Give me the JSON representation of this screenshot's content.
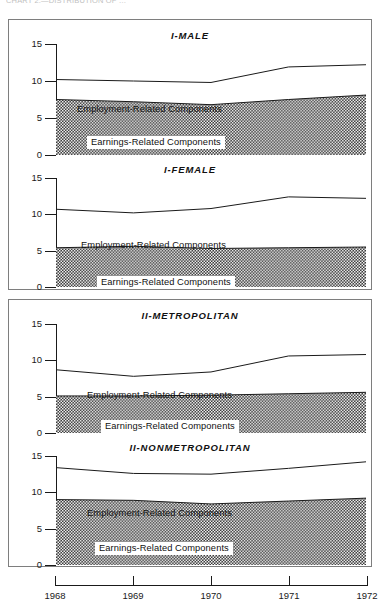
{
  "figure": {
    "caption_fragment": "CHART 2.—DISTRIBUTION OF …",
    "x_axis": {
      "tick_labels": [
        "1968",
        "1969",
        "1970",
        "1971",
        "1972"
      ],
      "values": [
        1968,
        1969,
        1970,
        1971,
        1972
      ]
    },
    "y_axis": {
      "tick_labels": [
        "0",
        "5",
        "10",
        "15"
      ],
      "values": [
        0,
        5,
        10,
        15
      ],
      "min": 0,
      "max": 15
    },
    "series_labels": {
      "employment": "Employment-Related Components",
      "earnings": "Earnings-Related Components"
    },
    "colors": {
      "axis": "#1a1a1a",
      "border": "#7e7e7e",
      "earnings_fill": "#3a3a3a",
      "employment_fill": "#ffffff",
      "line": "#1a1a1a"
    },
    "groups": [
      {
        "name": "group-1",
        "panels": [
          "I-MALE",
          "I-FEMALE"
        ]
      },
      {
        "name": "group-2",
        "panels": [
          "II-METROPOLITAN",
          "II-NONMETROPOLITAN"
        ]
      }
    ]
  },
  "chart_data": [
    {
      "type": "area",
      "title": "I-MALE",
      "xlabel": "",
      "ylabel": "",
      "x": [
        1968,
        1969,
        1970,
        1971,
        1972
      ],
      "xlim": [
        1968,
        1972
      ],
      "ylim": [
        0,
        15
      ],
      "yticks": [
        0,
        5,
        10,
        15
      ],
      "grid": false,
      "stacked": true,
      "legend": "inline-annotation",
      "series": [
        {
          "name": "Earnings-Related Components",
          "values": [
            7.5,
            7.2,
            6.8,
            7.5,
            8.1
          ]
        },
        {
          "name": "Employment-Related Components",
          "values": [
            2.7,
            2.8,
            3.0,
            4.4,
            4.1
          ]
        }
      ],
      "total_line": [
        10.2,
        10.0,
        9.8,
        11.9,
        12.2
      ]
    },
    {
      "type": "area",
      "title": "I-FEMALE",
      "xlabel": "",
      "ylabel": "",
      "x": [
        1968,
        1969,
        1970,
        1971,
        1972
      ],
      "xlim": [
        1968,
        1972
      ],
      "ylim": [
        0,
        15
      ],
      "yticks": [
        0,
        5,
        10,
        15
      ],
      "grid": false,
      "stacked": true,
      "legend": "inline-annotation",
      "series": [
        {
          "name": "Earnings-Related Components",
          "values": [
            5.4,
            5.6,
            5.3,
            5.4,
            5.5
          ]
        },
        {
          "name": "Employment-Related Components",
          "values": [
            5.3,
            4.6,
            5.5,
            7.0,
            6.7
          ]
        }
      ],
      "total_line": [
        10.7,
        10.2,
        10.8,
        12.4,
        12.2
      ]
    },
    {
      "type": "area",
      "title": "II-METROPOLITAN",
      "xlabel": "",
      "ylabel": "",
      "x": [
        1968,
        1969,
        1970,
        1971,
        1972
      ],
      "xlim": [
        1968,
        1972
      ],
      "ylim": [
        0,
        15
      ],
      "yticks": [
        0,
        5,
        10,
        15
      ],
      "grid": false,
      "stacked": true,
      "legend": "inline-annotation",
      "series": [
        {
          "name": "Earnings-Related Components",
          "values": [
            5.1,
            5.1,
            5.2,
            5.4,
            5.6
          ]
        },
        {
          "name": "Employment-Related Components",
          "values": [
            3.6,
            2.7,
            3.2,
            5.2,
            5.2
          ]
        }
      ],
      "total_line": [
        8.7,
        7.8,
        8.4,
        10.6,
        10.8
      ]
    },
    {
      "type": "area",
      "title": "II-NONMETROPOLITAN",
      "xlabel": "",
      "ylabel": "",
      "x": [
        1968,
        1969,
        1970,
        1971,
        1972
      ],
      "xlim": [
        1968,
        1972
      ],
      "ylim": [
        0,
        15
      ],
      "yticks": [
        0,
        5,
        10,
        15
      ],
      "grid": false,
      "stacked": true,
      "legend": "inline-annotation",
      "series": [
        {
          "name": "Earnings-Related Components",
          "values": [
            9.0,
            8.9,
            8.4,
            8.8,
            9.2
          ]
        },
        {
          "name": "Employment-Related Components",
          "values": [
            4.4,
            3.7,
            4.1,
            4.5,
            5.0
          ]
        }
      ],
      "total_line": [
        13.4,
        12.6,
        12.5,
        13.3,
        14.2
      ]
    }
  ]
}
